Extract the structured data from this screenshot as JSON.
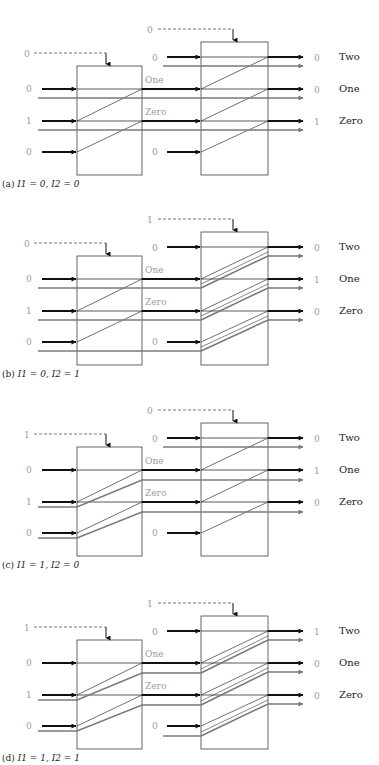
{
  "figure": {
    "output_names": [
      "Two",
      "One",
      "Zero"
    ],
    "intermediate_names": [
      "One",
      "Zero"
    ],
    "colors": {
      "signal": "#111111",
      "carry": "#7a7a7a",
      "box": "#555555",
      "value_text": "#9a9a9a",
      "label_text": "#222222",
      "dashed": "#666666"
    },
    "panels": [
      {
        "id": "a",
        "caption_prefix": "(a)",
        "caption": "I1 = 0, I2 = 0",
        "I1": 0,
        "I2": 0,
        "offset_y": 0,
        "stage1": {
          "control": "0",
          "inputs": [
            "0",
            "1",
            "0"
          ],
          "shifted": false
        },
        "stage2": {
          "control": "0",
          "top_input": "0",
          "bottom_input": "0",
          "shifted": false
        },
        "outputs": [
          "0",
          "0",
          "1"
        ]
      },
      {
        "id": "b",
        "caption_prefix": "(b)",
        "caption": "I1 = 0, I2 = 1",
        "I1": 0,
        "I2": 1,
        "offset_y": 190,
        "stage1": {
          "control": "0",
          "inputs": [
            "0",
            "1",
            "0"
          ],
          "shifted": false
        },
        "stage2": {
          "control": "1",
          "top_input": "0",
          "bottom_input": "0",
          "shifted": true
        },
        "outputs": [
          "0",
          "1",
          "0"
        ]
      },
      {
        "id": "c",
        "caption_prefix": "(c)",
        "caption": "I1 = 1, I2 = 0",
        "I1": 1,
        "I2": 0,
        "offset_y": 381,
        "stage1": {
          "control": "1",
          "inputs": [
            "0",
            "1",
            "0"
          ],
          "shifted": true
        },
        "stage2": {
          "control": "0",
          "top_input": "0",
          "bottom_input": "0",
          "shifted": false
        },
        "outputs": [
          "0",
          "1",
          "0"
        ]
      },
      {
        "id": "d",
        "caption_prefix": "(d)",
        "caption": "I1 = 1, I2 = 1",
        "I1": 1,
        "I2": 1,
        "offset_y": 574,
        "stage1": {
          "control": "1",
          "inputs": [
            "0",
            "1",
            "0"
          ],
          "shifted": true
        },
        "stage2": {
          "control": "1",
          "top_input": "0",
          "bottom_input": "0",
          "shifted": true
        },
        "outputs": [
          "1",
          "0",
          "0"
        ]
      }
    ]
  }
}
